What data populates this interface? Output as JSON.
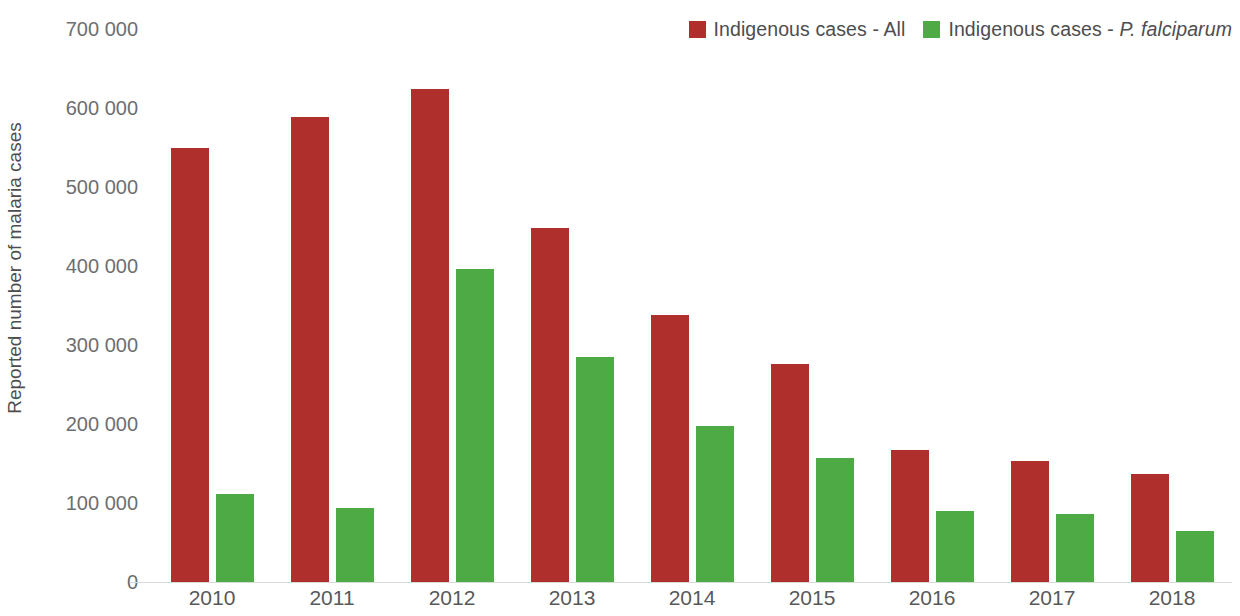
{
  "chart_data": {
    "type": "bar",
    "title": "",
    "xlabel": "",
    "ylabel": "Reported number of malaria cases",
    "categories": [
      "2010",
      "2011",
      "2012",
      "2013",
      "2014",
      "2015",
      "2016",
      "2017",
      "2018"
    ],
    "ylim": [
      0,
      700000
    ],
    "y_ticks": [
      0,
      100000,
      200000,
      300000,
      400000,
      500000,
      600000,
      700000
    ],
    "y_tick_labels": [
      "0",
      "100 000",
      "200 000",
      "300 000",
      "400 000",
      "500 000",
      "600 000",
      "700 000"
    ],
    "grid": false,
    "legend_position": "top-right",
    "series": [
      {
        "name": "Indigenous cases - All",
        "color": "#ae2f2b",
        "values": [
          550000,
          589000,
          624000,
          448000,
          338000,
          276000,
          167000,
          153000,
          137000
        ]
      },
      {
        "name": "Indigenous cases - P. falciparum",
        "color": "#4daa44",
        "values": [
          111000,
          94000,
          396000,
          285000,
          198000,
          157000,
          90000,
          86000,
          64000
        ]
      }
    ]
  },
  "legend": {
    "items": [
      {
        "label_plain": "Indigenous cases - All",
        "label_prefix": "Indigenous cases - All",
        "label_species": "",
        "color": "#ae2f2b"
      },
      {
        "label_plain": "Indigenous cases - P. falciparum",
        "label_prefix": "Indigenous cases - ",
        "label_species": "P. falciparum",
        "color": "#4daa44"
      }
    ]
  },
  "axis": {
    "y_title": "Reported number of malaria cases",
    "zero_label": "0"
  },
  "colors": {
    "red": "#ae2f2b",
    "green": "#4daa44",
    "text": "#58595b",
    "axis_line": "#d9d9d9",
    "background": "#ffffff"
  }
}
